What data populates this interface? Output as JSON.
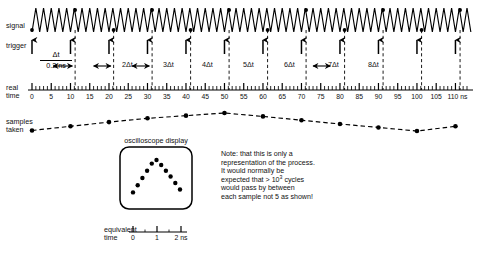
{
  "figure": {
    "row_labels": {
      "signal": "signal",
      "trigger": "trigger",
      "real_time": "real\ntime",
      "samples_taken": "samples\ntaken",
      "equivalent_time": "equivalent\ntime"
    },
    "delta_t": {
      "numerator": "Δt",
      "denominator": "0.2 ns",
      "multiples": [
        "2Δt",
        "3Δt",
        "4Δt",
        "5Δt",
        "6Δt",
        "7Δt",
        "8Δt"
      ]
    },
    "scope": {
      "caption": "oscilloscope display"
    },
    "note": {
      "line1": "Note: that this is only a",
      "line2": "representation of the process.",
      "line3": "It would normally be",
      "line4_pre": "expected that > 10",
      "line4_sup": "3",
      "line4_post": " cycles",
      "line5": "would pass by between",
      "line6": "each sample not 5 as shown!"
    },
    "colors": {
      "ink": "#000000",
      "background": "#ffffff"
    }
  },
  "chart_data": {
    "type": "line",
    "xlabel": "real time",
    "ylabel": "",
    "real_time_axis": {
      "unit": "ns",
      "unit_label": "ns",
      "min": 0,
      "max": 113,
      "major_step": 5,
      "minor_step": 1,
      "tick_labels": [
        0,
        5,
        10,
        15,
        20,
        25,
        30,
        35,
        40,
        45,
        50,
        55,
        60,
        65,
        70,
        75,
        80,
        85,
        90,
        95,
        100,
        105,
        110
      ]
    },
    "equivalent_time_axis": {
      "unit": "ns",
      "unit_label": "2 ns",
      "tick_labels": [
        "0",
        "1",
        "2 ns"
      ],
      "values": [
        0,
        1,
        2
      ]
    },
    "signal": {
      "waveform": "triangle",
      "period_ns": 2.0,
      "cycles_shown": 56,
      "description": "continuous triangular signal waveform"
    },
    "trigger": {
      "count": 12,
      "interval_ns": 10,
      "times_ns": [
        0,
        10,
        20,
        30,
        40,
        50,
        60,
        70,
        80,
        90,
        100,
        110
      ],
      "description": "trigger arrows every 10 ns"
    },
    "sample_points": {
      "description": "samples taken at successive trigger instants, each delayed by an extra delta-t",
      "count": 12,
      "times_ns": [
        0,
        10,
        20,
        30,
        40,
        50,
        60,
        70,
        80,
        90,
        100,
        110
      ],
      "delta_steps": [
        0,
        1,
        2,
        3,
        4,
        5,
        6,
        7,
        8,
        9,
        10,
        11
      ],
      "amplitudes": [
        0.08,
        0.3,
        0.52,
        0.72,
        0.86,
        1.0,
        0.82,
        0.62,
        0.42,
        0.24,
        0.05,
        0.3
      ]
    },
    "scope_trace": {
      "type": "scatter",
      "description": "reconstructed equivalent-time triangle displayed on the oscilloscope",
      "x": [
        0.0,
        0.18,
        0.36,
        0.54,
        0.72,
        0.9,
        1.08,
        1.26,
        1.44,
        1.62,
        1.8
      ],
      "y": [
        0.1,
        0.3,
        0.5,
        0.7,
        0.9,
        1.0,
        0.86,
        0.7,
        0.54,
        0.36,
        0.18
      ]
    }
  }
}
